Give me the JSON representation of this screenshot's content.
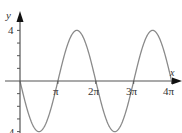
{
  "chart_data": {
    "type": "line",
    "title": "",
    "function": "y = -4 sin(x)",
    "xlabel": "x",
    "ylabel": "y",
    "x_ticks": [
      "π",
      "2π",
      "3π",
      "4π"
    ],
    "x_tick_values": [
      3.1416,
      6.2832,
      9.4248,
      12.5664
    ],
    "y_tick_labels": [
      "4",
      "-4"
    ],
    "y_tick_values": [
      4,
      3,
      2,
      1,
      -1,
      -2,
      -3,
      -4
    ],
    "xlim": [
      0,
      12.8
    ],
    "ylim": [
      -4,
      4.5
    ],
    "grid": false,
    "legend": null,
    "series": [
      {
        "name": "y = -4 sin(x)",
        "x": [
          0,
          1.5708,
          3.1416,
          4.7124,
          6.2832,
          7.854,
          9.4248,
          10.9956,
          12.5664
        ],
        "values": [
          0,
          -4,
          0,
          4,
          0,
          -4,
          0,
          4,
          0
        ]
      }
    ],
    "colors": {
      "curve": "#8a8a8a",
      "axis": "#555555",
      "arrow": "#111111"
    }
  },
  "axes": {
    "x_label": "x",
    "y_label": "y",
    "x_ticks": [
      "π",
      "2π",
      "3π",
      "4π"
    ],
    "y_top_label": "4",
    "y_bottom_label": "-4"
  }
}
